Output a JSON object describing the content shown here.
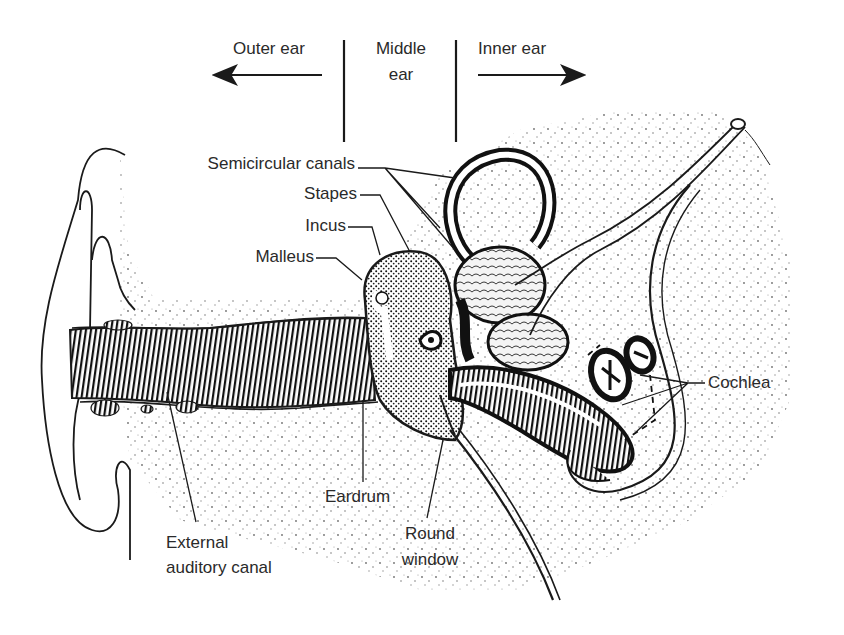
{
  "diagram": {
    "regions": {
      "outer": {
        "label": "Outer ear",
        "arrow": "left"
      },
      "middle": {
        "label_line1": "Middle",
        "label_line2": "ear"
      },
      "inner": {
        "label": "Inner ear",
        "arrow": "right"
      }
    },
    "labels": {
      "semicircular_canals": "Semicircular canals",
      "stapes": "Stapes",
      "incus": "Incus",
      "malleus": "Malleus",
      "cochlea": "Cochlea",
      "eardrum": "Eardrum",
      "round_window_line1": "Round",
      "round_window_line2": "window",
      "external_canal_line1": "External",
      "external_canal_line2": "auditory canal"
    },
    "colors": {
      "ink": "#1a1a1a",
      "text": "#2a2a2a",
      "background": "#ffffff",
      "stipple": "#555555"
    }
  }
}
